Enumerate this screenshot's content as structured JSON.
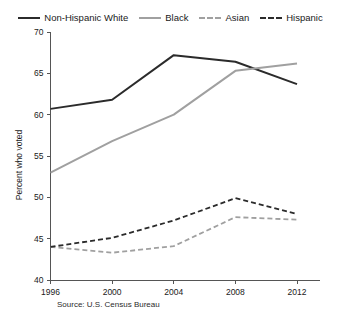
{
  "chart_data": {
    "type": "line",
    "title": "",
    "xlabel": "",
    "ylabel": "Percent who voted",
    "categories": [
      "1996",
      "2000",
      "2004",
      "2008",
      "2012"
    ],
    "x": [
      1996,
      2000,
      2004,
      2008,
      2012
    ],
    "xlim": [
      1996,
      2012
    ],
    "ylim": [
      40,
      70
    ],
    "yticks": [
      40,
      45,
      50,
      55,
      60,
      65,
      70
    ],
    "xticks": [
      1996,
      2000,
      2004,
      2008,
      2012
    ],
    "grid": false,
    "legend_position": "top",
    "source": "Source: U.S. Census Bureau",
    "series": [
      {
        "name": "Non-Hispanic White",
        "values": [
          60.7,
          61.8,
          67.2,
          66.4,
          63.7
        ],
        "color": "#2b2b2b",
        "style": "solid"
      },
      {
        "name": "Black",
        "values": [
          53.0,
          56.8,
          60.0,
          65.3,
          66.2
        ],
        "color": "#a0a0a0",
        "style": "solid"
      },
      {
        "name": "Asian",
        "values": [
          44.0,
          43.3,
          44.1,
          47.6,
          47.3
        ],
        "color": "#a0a0a0",
        "style": "dashed"
      },
      {
        "name": "Hispanic",
        "values": [
          44.0,
          45.1,
          47.2,
          49.9,
          48.0
        ],
        "color": "#2b2b2b",
        "style": "dashed"
      }
    ]
  },
  "legend": {
    "items": [
      {
        "label": "Non-Hispanic White"
      },
      {
        "label": "Black"
      },
      {
        "label": "Asian"
      },
      {
        "label": "Hispanic"
      }
    ]
  },
  "axis": {
    "y_title": "Percent who voted",
    "y_labels": [
      "70",
      "65",
      "60",
      "55",
      "50",
      "45",
      "40"
    ],
    "x_labels": [
      "1996",
      "2000",
      "2004",
      "2008",
      "2012"
    ]
  },
  "footer": {
    "source": "Source: U.S. Census Bureau"
  }
}
